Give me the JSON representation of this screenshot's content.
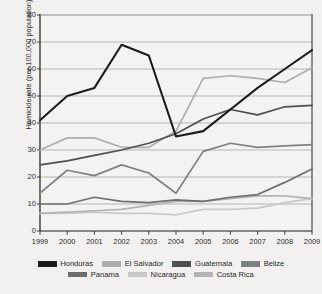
{
  "chart_data": {
    "type": "line",
    "title": "",
    "xlabel": "",
    "ylabel": "Homicide rate (per 100,000 population)",
    "categories": [
      "1999",
      "2000",
      "2001",
      "2002",
      "2003",
      "2004",
      "2005",
      "2006",
      "2007",
      "2008",
      "2009"
    ],
    "x": [
      1999,
      2000,
      2001,
      2002,
      2003,
      2004,
      2005,
      2006,
      2007,
      2008,
      2009
    ],
    "ylim": [
      0,
      80
    ],
    "yticks": [
      0,
      10,
      20,
      30,
      40,
      50,
      60,
      70,
      80
    ],
    "grid": true,
    "legend_position": "bottom",
    "series": [
      {
        "name": "Honduras",
        "color": "#1c1c1c",
        "values": [
          41,
          50,
          53,
          69,
          65,
          35,
          37,
          45,
          53,
          60,
          67
        ]
      },
      {
        "name": "El Salvador",
        "color": "#aeaeae",
        "values": [
          30,
          34.5,
          34.5,
          31,
          31,
          37,
          56.5,
          57.5,
          56.5,
          55,
          60.5
        ]
      },
      {
        "name": "Guatemala",
        "color": "#4f4f4f",
        "values": [
          24.5,
          26,
          28,
          30,
          32.5,
          36,
          41.5,
          45,
          43,
          46,
          46.5
        ]
      },
      {
        "name": "Belize",
        "color": "#808080",
        "values": [
          14,
          22.5,
          20.5,
          24.5,
          21.5,
          14,
          29.5,
          32.5,
          31,
          31.5,
          32
        ]
      },
      {
        "name": "Panama",
        "color": "#6e6e6e",
        "values": [
          10,
          10,
          12.5,
          11,
          10.5,
          11.5,
          11,
          12.5,
          13.5,
          18,
          23
        ]
      },
      {
        "name": "Nicaragua",
        "color": "#c9c9c9",
        "values": [
          6.5,
          6.5,
          7,
          6.5,
          6.5,
          6,
          8,
          8,
          8.5,
          10.5,
          12
        ]
      },
      {
        "name": "Costa Rica",
        "color": "#b4b4b4",
        "values": [
          6.5,
          7,
          7.5,
          8,
          9.5,
          11,
          11,
          12,
          13,
          13,
          12
        ]
      }
    ]
  },
  "legend": {
    "row1": [
      {
        "label": "Honduras",
        "color": "#1c1c1c"
      },
      {
        "label": "El Salvador",
        "color": "#aeaeae"
      },
      {
        "label": "Guatemala",
        "color": "#4f4f4f"
      },
      {
        "label": "Belize",
        "color": "#808080"
      }
    ],
    "row2": [
      {
        "label": "Panama",
        "color": "#6e6e6e"
      },
      {
        "label": "Nicaragua",
        "color": "#c9c9c9"
      },
      {
        "label": "Costa Rica",
        "color": "#b4b4b4"
      }
    ]
  },
  "axis": {
    "y_tick_labels": [
      "80",
      "70",
      "60",
      "50",
      "40",
      "30",
      "20",
      "10",
      "0"
    ],
    "x_tick_labels": [
      "1999",
      "2000",
      "2001",
      "2002",
      "2003",
      "2004",
      "2005",
      "2006",
      "2007",
      "2008",
      "2009"
    ]
  },
  "colors": {
    "background": "#f2f1ef",
    "grid": "#9c9c9c",
    "axis": "#3a3a3a",
    "text": "#2b2b2b"
  }
}
